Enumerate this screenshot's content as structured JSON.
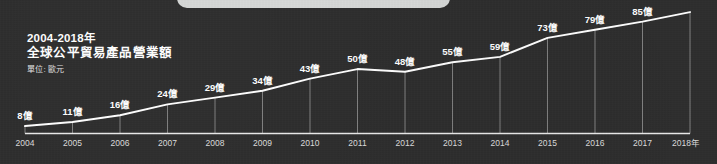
{
  "card": {
    "background_color": "#2e2e2e",
    "top_tab_color": "#d6d8d7"
  },
  "title": {
    "line1": "2004-2018年",
    "line2": "全球公平貿易產品營業額",
    "unit": "單位: 歐元"
  },
  "chart_data": {
    "type": "line",
    "title": "全球公平貿易產品營業額",
    "subtitle": "2004-2018年",
    "xlabel": "",
    "ylabel": "單位: 歐元",
    "unit_suffix": "億",
    "grid": true,
    "legend": "none",
    "line_color": "#ffffff",
    "axis_color": "#e9e9e9",
    "categories": [
      "2004",
      "2005",
      "2006",
      "2007",
      "2008",
      "2009",
      "2010",
      "2011",
      "2012",
      "2013",
      "2014",
      "2015",
      "2016",
      "2017",
      "2018年"
    ],
    "values": [
      8,
      11,
      16,
      24,
      29,
      34,
      43,
      50,
      48,
      55,
      59,
      73,
      79,
      85,
      92
    ],
    "point_labels": [
      "8億",
      "11億",
      "16億",
      "24億",
      "29億",
      "34億",
      "43億",
      "50億",
      "48億",
      "55億",
      "59億",
      "73億",
      "79億",
      "85億",
      ""
    ],
    "ylim": [
      0,
      100
    ],
    "xlim": [
      "2004",
      "2018"
    ]
  }
}
